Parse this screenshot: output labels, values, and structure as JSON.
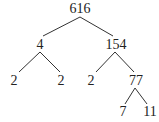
{
  "diagram": {
    "type": "factor-tree",
    "nodes": [
      {
        "id": "n616",
        "label": "616",
        "x": 80,
        "y": 2
      },
      {
        "id": "n4",
        "label": "4",
        "x": 40,
        "y": 38
      },
      {
        "id": "n154",
        "label": "154",
        "x": 116,
        "y": 38
      },
      {
        "id": "n2a",
        "label": "2",
        "x": 14,
        "y": 74
      },
      {
        "id": "n2b",
        "label": "2",
        "x": 61,
        "y": 74
      },
      {
        "id": "n2c",
        "label": "2",
        "x": 91,
        "y": 74
      },
      {
        "id": "n77",
        "label": "77",
        "x": 136,
        "y": 74
      },
      {
        "id": "n7",
        "label": "7",
        "x": 123,
        "y": 105
      },
      {
        "id": "n11",
        "label": "11",
        "x": 150,
        "y": 105
      }
    ],
    "edges": [
      {
        "from": "616",
        "to": "4",
        "x1": 80,
        "y1": 17,
        "x2": 43,
        "y2": 36
      },
      {
        "from": "616",
        "to": "154",
        "x1": 80,
        "y1": 17,
        "x2": 113,
        "y2": 36
      },
      {
        "from": "4",
        "to": "2",
        "x1": 40,
        "y1": 52,
        "x2": 19,
        "y2": 72
      },
      {
        "from": "4",
        "to": "2",
        "x1": 40,
        "y1": 52,
        "x2": 60,
        "y2": 72
      },
      {
        "from": "154",
        "to": "2",
        "x1": 115,
        "y1": 52,
        "x2": 96,
        "y2": 72
      },
      {
        "from": "154",
        "to": "77",
        "x1": 115,
        "y1": 52,
        "x2": 134,
        "y2": 72
      },
      {
        "from": "77",
        "to": "7",
        "x1": 135,
        "y1": 88,
        "x2": 125,
        "y2": 104
      },
      {
        "from": "77",
        "to": "11",
        "x1": 135,
        "y1": 88,
        "x2": 147,
        "y2": 104
      }
    ]
  }
}
